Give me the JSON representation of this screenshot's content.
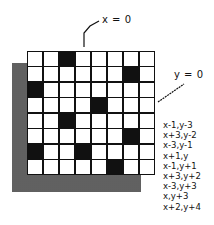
{
  "diagram": {
    "x_label": "x = 0",
    "y_label": "y = 0",
    "grid": {
      "rows": 8,
      "cols": 8,
      "filled_cells": [
        {
          "row": 0,
          "col": 2
        },
        {
          "row": 1,
          "col": 6
        },
        {
          "row": 2,
          "col": 0
        },
        {
          "row": 3,
          "col": 4
        },
        {
          "row": 4,
          "col": 2
        },
        {
          "row": 5,
          "col": 6
        },
        {
          "row": 6,
          "col": 0
        },
        {
          "row": 6,
          "col": 3
        },
        {
          "row": 7,
          "col": 5
        }
      ]
    },
    "offsets": [
      "x-1,y-3",
      "x+3,y-2",
      "x-3,y-1",
      "x+1,y",
      "x-1,y+1",
      "x+3,y+2",
      "x-3,y+3",
      "x,y+3",
      "x+2,y+4"
    ],
    "colors": {
      "ink": "#111111",
      "paper": "#ffffff"
    }
  }
}
